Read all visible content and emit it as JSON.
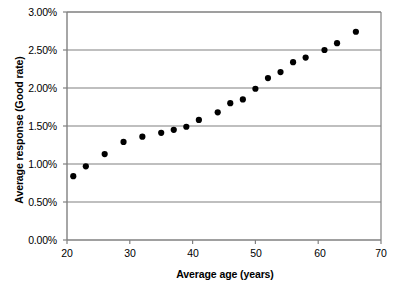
{
  "chart_data": {
    "type": "scatter",
    "title": "",
    "xlabel": "Average age (years)",
    "ylabel": "Average response (Good rate)",
    "xlim": [
      20,
      70
    ],
    "ylim": [
      0,
      3
    ],
    "xticks": [
      "20",
      "30",
      "40",
      "50",
      "60",
      "70"
    ],
    "yticks": [
      "0.00%",
      "0.50%",
      "1.00%",
      "1.50%",
      "2.00%",
      "2.50%",
      "3.00%"
    ],
    "xtick_values": [
      20,
      30,
      40,
      50,
      60,
      70
    ],
    "ytick_values": [
      0,
      0.5,
      1.0,
      1.5,
      2.0,
      2.5,
      3.0
    ],
    "grid": "horizontal",
    "legend": "none",
    "marker": "filled-circle",
    "marker_color": "#000000",
    "series": [
      {
        "name": "Average response (Good rate) by average age",
        "x": [
          21,
          23,
          26,
          29,
          32,
          35,
          37,
          39,
          41,
          44,
          46,
          48,
          50,
          52,
          54,
          56,
          58,
          61,
          63,
          66
        ],
        "y": [
          0.84,
          0.97,
          1.13,
          1.29,
          1.36,
          1.41,
          1.45,
          1.49,
          1.58,
          1.68,
          1.8,
          1.85,
          1.99,
          2.13,
          2.21,
          2.34,
          2.4,
          2.5,
          2.59,
          2.74
        ]
      }
    ]
  },
  "axis": {
    "y_label_text": "Average response (Good rate)",
    "x_label_text": "Average age (years)",
    "y_tick_0": "0.00%",
    "y_tick_1": "0.50%",
    "y_tick_2": "1.00%",
    "y_tick_3": "1.50%",
    "y_tick_4": "2.00%",
    "y_tick_5": "2.50%",
    "y_tick_6": "3.00%",
    "x_tick_0": "20",
    "x_tick_1": "30",
    "x_tick_2": "40",
    "x_tick_3": "50",
    "x_tick_4": "60",
    "x_tick_5": "70"
  },
  "style": {
    "axis_color": "#808080",
    "grid_color": "#808080",
    "marker_color": "#000000",
    "background": "#ffffff"
  }
}
